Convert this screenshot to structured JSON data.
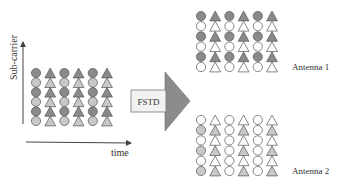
{
  "axes": {
    "y_label": "Sub-carrier",
    "x_label": "time"
  },
  "arrow": {
    "label": "FSTD",
    "fill": "#8c8c8c",
    "body_fill": "#f2f2f2"
  },
  "colors": {
    "dark": "#8a8a8a",
    "light": "#c8c8c8",
    "empty": "#ffffff",
    "stroke": "#555555"
  },
  "grids": [
    {
      "name": "input",
      "label": "",
      "x": 36,
      "y": 73,
      "col_spacing": 14.2,
      "row_spacing": 9.6,
      "columns": [
        "circle",
        "triangle",
        "circle",
        "triangle",
        "circle",
        "triangle"
      ],
      "fills": [
        [
          "dark",
          "dark",
          "dark",
          "dark",
          "dark",
          "dark"
        ],
        [
          "light",
          "light",
          "light",
          "light",
          "light",
          "light"
        ],
        [
          "dark",
          "dark",
          "dark",
          "dark",
          "dark",
          "dark"
        ],
        [
          "light",
          "light",
          "light",
          "light",
          "light",
          "light"
        ],
        [
          "dark",
          "dark",
          "dark",
          "dark",
          "dark",
          "dark"
        ],
        [
          "light",
          "light",
          "light",
          "light",
          "light",
          "light"
        ]
      ]
    },
    {
      "name": "antenna-1",
      "label": "Antenna 1",
      "x": 201,
      "y": 16,
      "col_spacing": 14.2,
      "row_spacing": 10.2,
      "columns": [
        "circle",
        "triangle",
        "circle",
        "triangle",
        "circle",
        "triangle"
      ],
      "fills": [
        [
          "dark",
          "dark",
          "dark",
          "dark",
          "dark",
          "dark"
        ],
        [
          "empty",
          "empty",
          "empty",
          "empty",
          "empty",
          "empty"
        ],
        [
          "dark",
          "dark",
          "dark",
          "dark",
          "dark",
          "dark"
        ],
        [
          "empty",
          "empty",
          "empty",
          "empty",
          "empty",
          "empty"
        ],
        [
          "dark",
          "dark",
          "dark",
          "dark",
          "dark",
          "dark"
        ],
        [
          "empty",
          "empty",
          "empty",
          "empty",
          "empty",
          "empty"
        ]
      ]
    },
    {
      "name": "antenna-2",
      "label": "Antenna 2",
      "x": 201,
      "y": 120,
      "col_spacing": 14.2,
      "row_spacing": 10.2,
      "columns": [
        "circle",
        "triangle",
        "circle",
        "triangle",
        "circle",
        "triangle"
      ],
      "fills": [
        [
          "empty",
          "empty",
          "empty",
          "empty",
          "empty",
          "empty"
        ],
        [
          "light",
          "light",
          "empty",
          "light",
          "empty",
          "light"
        ],
        [
          "empty",
          "empty",
          "empty",
          "empty",
          "empty",
          "empty"
        ],
        [
          "light",
          "light",
          "empty",
          "light",
          "empty",
          "light"
        ],
        [
          "empty",
          "empty",
          "empty",
          "empty",
          "empty",
          "empty"
        ],
        [
          "light",
          "light",
          "empty",
          "light",
          "empty",
          "light"
        ]
      ]
    }
  ]
}
